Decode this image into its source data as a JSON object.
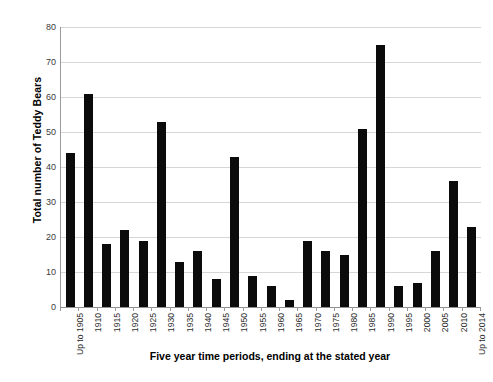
{
  "chart_data": {
    "type": "bar",
    "title": "",
    "xlabel": "Five year time periods, ending at the stated year",
    "ylabel": "Total number of Teddy Bears",
    "ylim": [
      0,
      80
    ],
    "ytick_step": 10,
    "yticks": [
      "0",
      "10",
      "20",
      "30",
      "40",
      "50",
      "60",
      "70",
      "80"
    ],
    "grid": true,
    "legend": "none",
    "bar_color": "#0b0b0b",
    "categories": [
      "Up to 1905",
      "1910",
      "1915",
      "1920",
      "1925",
      "1930",
      "1935",
      "1940",
      "1945",
      "1950",
      "1955",
      "1960",
      "1965",
      "1970",
      "1975",
      "1980",
      "1985",
      "1990",
      "1995",
      "2000",
      "2005",
      "2010",
      "Up to 2014"
    ],
    "values": [
      44,
      61,
      18,
      22,
      19,
      53,
      13,
      16,
      8,
      43,
      9,
      6,
      2,
      19,
      16,
      15,
      51,
      75,
      6,
      7,
      16,
      36,
      23
    ]
  }
}
